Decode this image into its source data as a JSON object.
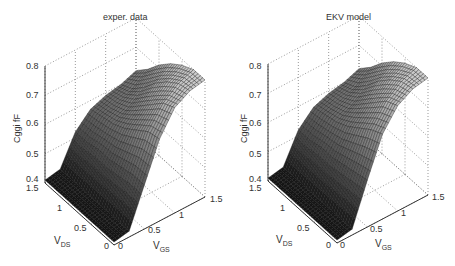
{
  "chart_data": [
    {
      "type": "surface",
      "title": "exper. data",
      "xlabel": "V_GS",
      "ylabel": "V_DS",
      "zlabel": "Cggi fF",
      "x_ticks": [
        "0",
        "0.5",
        "1",
        "1.5"
      ],
      "y_ticks": [
        "0",
        "0.5",
        "1",
        "1.5"
      ],
      "z_ticks": [
        "0.4",
        "0.5",
        "0.6",
        "0.7",
        "0.8"
      ],
      "xlim": [
        0,
        1.5
      ],
      "ylim": [
        0,
        1.5
      ],
      "zlim": [
        0.4,
        0.8
      ],
      "grid": true,
      "colormap": "gray",
      "V_GS": [
        0,
        0.25,
        0.5,
        0.75,
        1.0,
        1.25,
        1.5
      ],
      "V_DS": [
        0,
        0.25,
        0.5,
        0.75,
        1.0,
        1.25,
        1.5
      ],
      "Cgg_fF_rows_by_VDS": [
        [
          0.41,
          0.42,
          0.55,
          0.68,
          0.76,
          0.79,
          0.8
        ],
        [
          0.41,
          0.42,
          0.55,
          0.67,
          0.74,
          0.78,
          0.8
        ],
        [
          0.41,
          0.42,
          0.54,
          0.64,
          0.7,
          0.75,
          0.78
        ],
        [
          0.41,
          0.42,
          0.53,
          0.61,
          0.66,
          0.71,
          0.75
        ],
        [
          0.41,
          0.42,
          0.53,
          0.59,
          0.62,
          0.66,
          0.71
        ],
        [
          0.41,
          0.42,
          0.52,
          0.58,
          0.6,
          0.62,
          0.66
        ],
        [
          0.41,
          0.42,
          0.52,
          0.57,
          0.59,
          0.6,
          0.62
        ]
      ]
    },
    {
      "type": "surface",
      "title": "EKV model",
      "xlabel": "V_GS",
      "ylabel": "V_DS",
      "zlabel": "Cggi fF",
      "x_ticks": [
        "0",
        "0.5",
        "1",
        "1.5"
      ],
      "y_ticks": [
        "0",
        "0.5",
        "1",
        "1.5"
      ],
      "z_ticks": [
        "0.4",
        "0.5",
        "0.6",
        "0.7",
        "0.8"
      ],
      "xlim": [
        0,
        1.5
      ],
      "ylim": [
        0,
        1.5
      ],
      "zlim": [
        0.4,
        0.8
      ],
      "grid": true,
      "colormap": "gray",
      "V_GS": [
        0,
        0.25,
        0.5,
        0.75,
        1.0,
        1.25,
        1.5
      ],
      "V_DS": [
        0,
        0.25,
        0.5,
        0.75,
        1.0,
        1.25,
        1.5
      ],
      "Cgg_fF_rows_by_VDS": [
        [
          0.41,
          0.42,
          0.56,
          0.69,
          0.76,
          0.79,
          0.8
        ],
        [
          0.41,
          0.42,
          0.55,
          0.67,
          0.74,
          0.78,
          0.8
        ],
        [
          0.41,
          0.42,
          0.54,
          0.64,
          0.7,
          0.75,
          0.78
        ],
        [
          0.41,
          0.42,
          0.53,
          0.61,
          0.66,
          0.71,
          0.75
        ],
        [
          0.41,
          0.42,
          0.53,
          0.59,
          0.62,
          0.66,
          0.71
        ],
        [
          0.41,
          0.42,
          0.52,
          0.58,
          0.6,
          0.62,
          0.66
        ],
        [
          0.41,
          0.42,
          0.52,
          0.57,
          0.59,
          0.6,
          0.62
        ]
      ]
    }
  ],
  "panels": [
    {
      "title": "exper. data",
      "zlabel": "Cggi fF",
      "vds_label": "V",
      "vds_sub": "DS",
      "vgs_label": "V",
      "vgs_sub": "GS",
      "z_ticks": [
        "0.8",
        "0.7",
        "0.6",
        "0.5",
        "0.4"
      ],
      "vds_ticks": [
        "1.5",
        "1",
        "0.5",
        "0"
      ],
      "vgs_ticks": [
        "0",
        "0.5",
        "1",
        "1.5"
      ]
    },
    {
      "title": "EKV model",
      "zlabel": "Cggi fF",
      "vds_label": "V",
      "vds_sub": "DS",
      "vgs_label": "V",
      "vgs_sub": "GS",
      "z_ticks": [
        "0.8",
        "0.7",
        "0.6",
        "0.5",
        "0.4"
      ],
      "vds_ticks": [
        "1.5",
        "1",
        "0.5",
        "0"
      ],
      "vgs_ticks": [
        "0",
        "0.5",
        "1",
        "1.5"
      ]
    }
  ]
}
